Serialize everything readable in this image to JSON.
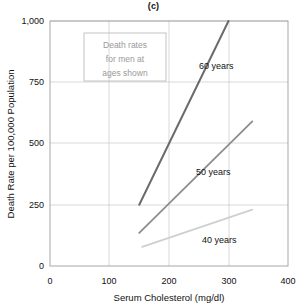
{
  "chart_data": {
    "type": "line",
    "title": "(c)",
    "xlabel": "Serum Cholesterol (mg/dl)",
    "ylabel": "Death Rate per 100,000 Population",
    "xlim": [
      0,
      400
    ],
    "ylim": [
      0,
      1000
    ],
    "xticks": [
      0,
      100,
      200,
      300,
      400
    ],
    "yticks": [
      0,
      250,
      500,
      750,
      1000
    ],
    "xtick_labels": [
      "0",
      "100",
      "200",
      "300",
      "400"
    ],
    "ytick_labels": [
      "0",
      "250",
      "500",
      "750",
      "1,000"
    ],
    "grid": true,
    "legend_position": "inline-labels",
    "annotation": {
      "lines": [
        "Death rates",
        "for men at",
        "ages shown"
      ],
      "color": "#9a9a9a",
      "border_color": "#bdbdbd"
    },
    "series": [
      {
        "name": "60 years",
        "label": "60 years",
        "color": "#6b6b6b",
        "width": 2.0,
        "x": [
          150,
          300
        ],
        "y": [
          250,
          1000
        ],
        "label_x": 252,
        "label_y": 880
      },
      {
        "name": "50 years",
        "label": "50 years",
        "color": "#8d8d8d",
        "width": 1.8,
        "x": [
          150,
          340
        ],
        "y": [
          135,
          590
        ],
        "label_x": 248,
        "label_y": 420
      },
      {
        "name": "40 years",
        "label": "40 years",
        "color": "#cfcfcf",
        "width": 1.8,
        "x": [
          155,
          340
        ],
        "y": [
          78,
          230
        ],
        "label_x": 258,
        "label_y": 150
      }
    ]
  }
}
